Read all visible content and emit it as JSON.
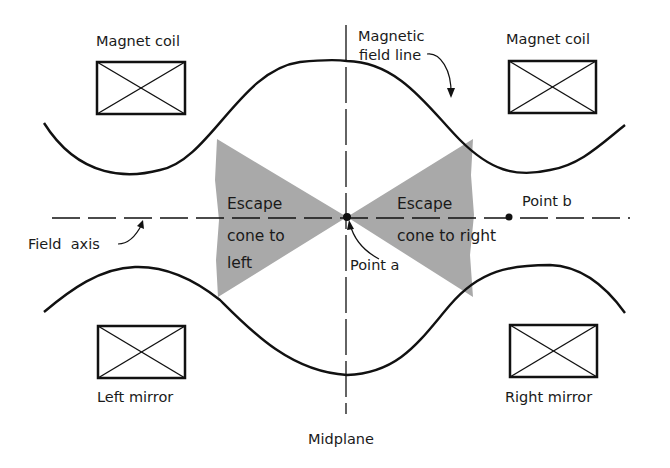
{
  "diagram": {
    "labels": {
      "coil_top_left": "Magnet coil",
      "coil_top_right": "Magnet coil",
      "field_line_1": "Magnetic",
      "field_line_2": "field line",
      "escape_left_1": "Escape",
      "escape_left_2": "cone to",
      "escape_left_3": "left",
      "escape_right_1": "Escape",
      "escape_right_2": "cone to right",
      "point_a": "Point a",
      "point_b": "Point b",
      "field_axis": "Field  axis",
      "left_mirror": "Left mirror",
      "right_mirror": "Right mirror",
      "midplane": "Midplane"
    },
    "colors": {
      "line": "#111111",
      "cone_fill": "#a9a9a9",
      "background": "#ffffff"
    },
    "elements": [
      "magnet-coil-top-left",
      "magnet-coil-top-right",
      "left-mirror-coil",
      "right-mirror-coil",
      "upper-field-line",
      "lower-field-line",
      "field-axis",
      "midplane-line",
      "escape-cone-left",
      "escape-cone-right",
      "point-a",
      "point-b"
    ]
  }
}
